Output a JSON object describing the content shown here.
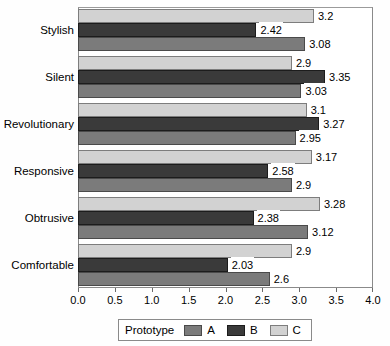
{
  "chart_data": {
    "type": "bar",
    "orientation": "horizontal",
    "title": "",
    "xlabel": "",
    "ylabel": "",
    "xlim": [
      0.0,
      4.0
    ],
    "xticks": [
      "0.0",
      "0.5",
      "1.0",
      "1.5",
      "2.0",
      "2.5",
      "3.0",
      "3.5",
      "4.0"
    ],
    "grid": false,
    "legend_position": "bottom",
    "legend_title": "Prototype",
    "categories": [
      "Stylish",
      "Silent",
      "Revolutionary",
      "Responsive",
      "Obtrusive",
      "Comfortable"
    ],
    "series": [
      {
        "name": "A",
        "color": "#7b7b7b",
        "values": [
          3.08,
          3.03,
          2.95,
          2.9,
          3.12,
          2.6
        ],
        "labels": [
          "3.08",
          "3.03",
          "2.95",
          "2.9",
          "3.12",
          "2.6"
        ]
      },
      {
        "name": "B",
        "color": "#3a3a3a",
        "values": [
          2.42,
          3.35,
          3.27,
          2.58,
          2.38,
          2.03
        ],
        "labels": [
          "2.42",
          "3.35",
          "3.27",
          "2.58",
          "2.38",
          "2.03"
        ]
      },
      {
        "name": "C",
        "color": "#d2d2d2",
        "values": [
          3.2,
          2.9,
          3.1,
          3.17,
          3.28,
          2.9
        ],
        "labels": [
          "3.2",
          "2.9",
          "3.1",
          "3.17",
          "3.28",
          "2.9"
        ]
      }
    ],
    "series_draw_order_top_to_bottom": [
      "C",
      "B",
      "A"
    ]
  }
}
